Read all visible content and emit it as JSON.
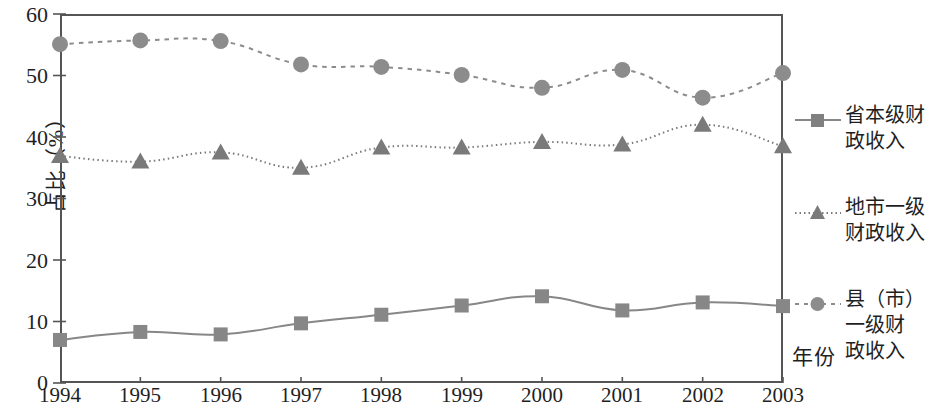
{
  "chart_data": {
    "type": "line",
    "title": "",
    "subtitle": "",
    "xlabel": "年份",
    "ylabel": "占比（%）",
    "x": [
      1994,
      1995,
      1996,
      1997,
      1998,
      1999,
      2000,
      2001,
      2002,
      2003
    ],
    "categories": [
      "1994",
      "1995",
      "1996",
      "1997",
      "1998",
      "1999",
      "2000",
      "2001",
      "2002",
      "2003"
    ],
    "xlim": [
      1994,
      2003
    ],
    "ylim": [
      0,
      60
    ],
    "y_ticks": [
      "0",
      "10",
      "20",
      "30",
      "40",
      "50",
      "60"
    ],
    "y_tick_values": [
      0,
      10,
      20,
      30,
      40,
      50,
      60
    ],
    "grid": false,
    "legend_position": "right",
    "series": [
      {
        "name": "省本级财政收入",
        "name_lines": [
          "省本级财",
          "政收入"
        ],
        "marker": "square",
        "linestyle": "solid",
        "color": "#878787",
        "values": [
          7.0,
          8.3,
          7.9,
          9.7,
          11.1,
          12.6,
          14.1,
          11.8,
          13.1,
          12.5
        ]
      },
      {
        "name": "地市一级财政收入",
        "name_lines": [
          "地市一级",
          "财政收入"
        ],
        "marker": "triangle",
        "linestyle": "dotted",
        "color": "#7a7a7a",
        "values": [
          36.9,
          36.0,
          37.5,
          35.0,
          38.3,
          38.3,
          39.2,
          38.8,
          42.0,
          38.5
        ]
      },
      {
        "name": "县（市）一级财政收入",
        "name_lines": [
          "县（市）",
          "一级财",
          "政收入"
        ],
        "marker": "circle",
        "linestyle": "dashed",
        "color": "#8c8c8c",
        "values": [
          55.1,
          55.7,
          55.6,
          51.8,
          51.4,
          50.1,
          48.0,
          50.9,
          46.4,
          50.4
        ]
      }
    ]
  },
  "colors": {
    "axis": "#555555",
    "text": "#1f1f1f",
    "marker_gray": "#808080"
  }
}
